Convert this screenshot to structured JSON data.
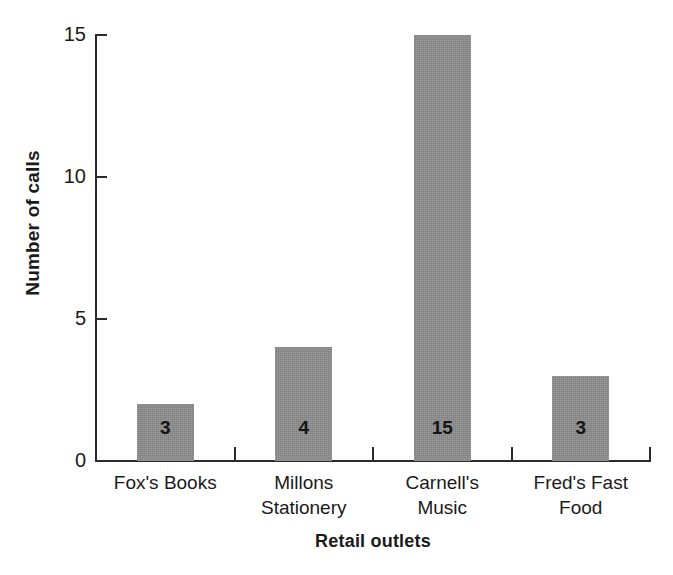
{
  "chart_data": {
    "type": "bar",
    "title": "",
    "subtitle": "",
    "xlabel": "Retail outlets",
    "ylabel": "Number of calls",
    "categories": [
      "Fox's Books",
      "Millons Stationery",
      "Carnell's Music",
      "Fred's Fast Food"
    ],
    "category_lines": [
      [
        "Fox's Books"
      ],
      [
        "Millons",
        "Stationery"
      ],
      [
        "Carnell's",
        "Music"
      ],
      [
        "Fred's Fast",
        "Food"
      ]
    ],
    "values": [
      3,
      4,
      15,
      3
    ],
    "drawn_heights": [
      2,
      4,
      15,
      3
    ],
    "data_labels": [
      "3",
      "4",
      "15",
      "3"
    ],
    "ylim": [
      0,
      15
    ],
    "yticks": [
      0,
      5,
      10,
      15
    ],
    "ytick_labels": [
      "0",
      "5",
      "10",
      "15"
    ],
    "grid": false,
    "legend": "none",
    "bar_color": "#8c8c8c",
    "axis_color": "#2b2b2b",
    "text_color": "#1a1a1a",
    "background_color": "#ffffff"
  },
  "axes": {
    "y_title": "Number of calls",
    "x_title": "Retail outlets"
  }
}
